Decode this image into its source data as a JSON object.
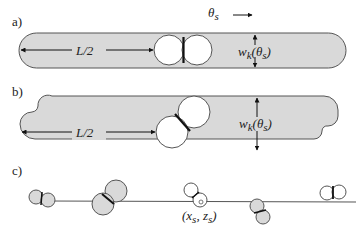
{
  "panels": {
    "a": {
      "label": "a)",
      "direction_label": "θs →",
      "theta_symbol": "θ",
      "theta_sub": "s",
      "length_label": "L/2",
      "width_label_w": "w",
      "width_label_k": "k",
      "width_label_arg": "(θ",
      "width_label_arg_sub": "s",
      "width_label_close": ")"
    },
    "b": {
      "label": "b)",
      "length_label": "L/2",
      "width_label_w": "w",
      "width_label_k": "k",
      "width_label_arg": "(θ",
      "width_label_arg_sub": "s",
      "width_label_close": ")"
    },
    "c": {
      "label": "c)",
      "point_label_open": "(x",
      "point_label_sub1": "s",
      "point_label_comma": ", z",
      "point_label_sub2": "s",
      "point_label_close": ")"
    }
  },
  "colors": {
    "fill_gray": "#d9d9d9",
    "stroke": "#555555",
    "white": "#ffffff",
    "dark": "#111111"
  }
}
